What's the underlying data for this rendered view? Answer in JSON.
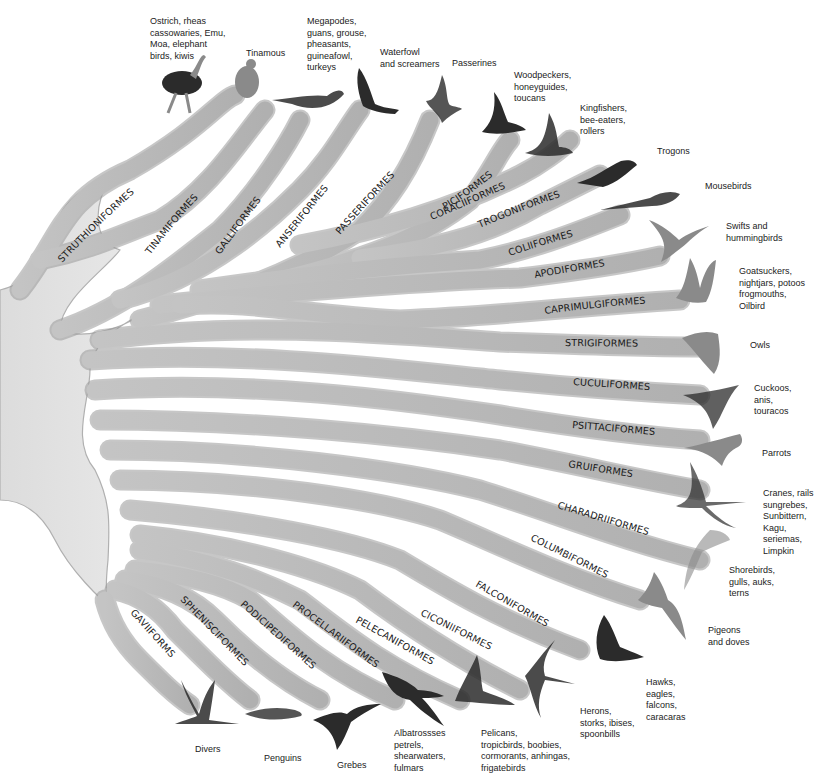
{
  "diagram": {
    "type": "phylogenetic-tree",
    "branch_color": "#b8b8b8",
    "branch_edge_color": "#8f8f8f",
    "background": "#ffffff"
  },
  "orders": [
    {
      "id": "struthioniformes",
      "label": "STRUTHIONIFORMES",
      "description": "Ostrich, rheas\ncassowaries, Emu,\nMoa, elephant\nbirds, kiwis"
    },
    {
      "id": "tinamiformes",
      "label": "TINAMIFORMES",
      "description": "Tinamous"
    },
    {
      "id": "galliformes",
      "label": "GALLIFORMES",
      "description": "Megapodes,\nguans, grouse,\npheasants,\nguineafowl,\nturkeys"
    },
    {
      "id": "anseriformes",
      "label": "ANSERIFORMES",
      "description": "Waterfowl\nand screamers"
    },
    {
      "id": "passeriformes",
      "label": "PASSERIFORMES",
      "description": "Passerines"
    },
    {
      "id": "piciformes",
      "label": "PICIFORMES",
      "description": "Woodpeckers,\nhoneyguides,\ntoucans"
    },
    {
      "id": "coraciiformes",
      "label": "CORACIIFORMES",
      "description": "Kingfishers,\nbee-eaters,\nrollers"
    },
    {
      "id": "trogoniformes",
      "label": "TROGONIFORMES",
      "description": "Trogons"
    },
    {
      "id": "coliiformes",
      "label": "COLIIFORMES",
      "description": "Mousebirds"
    },
    {
      "id": "apodiformes",
      "label": "APODIFORMES",
      "description": "Swifts and\nhummingbirds"
    },
    {
      "id": "caprimulgiformes",
      "label": "CAPRIMULGIFORMES",
      "description": "Goatsuckers,\nnightjars, potoos\nfrogmouths,\nOilbird"
    },
    {
      "id": "strigiformes",
      "label": "STRIGIFORMES",
      "description": "Owls"
    },
    {
      "id": "cuculiformes",
      "label": "CUCULIFORMES",
      "description": "Cuckoos,\nanis,\ntouracos"
    },
    {
      "id": "psittaciformes",
      "label": "PSITTACIFORMES",
      "description": "Parrots"
    },
    {
      "id": "gruiformes",
      "label": "GRUIFORMES",
      "description": "Cranes, rails\nsungrebes,\nSunbittern,\nKagu, seriemas,\nLimpkin"
    },
    {
      "id": "charadriiformes",
      "label": "CHARADRIIFORMES",
      "description": "Shorebirds,\ngulls, auks,\nterns"
    },
    {
      "id": "columbiformes",
      "label": "COLUMBIFORMES",
      "description": "Pigeons\nand doves"
    },
    {
      "id": "falconiformes",
      "label": "FALCONIFORMES",
      "description": "Hawks,\neagles,\nfalcons,\ncaracaras"
    },
    {
      "id": "ciconiiformes",
      "label": "CICONIIFORMES",
      "description": "Herons,\nstorks, ibises,\nspoonbills"
    },
    {
      "id": "pelecaniformes",
      "label": "PELECANIFORMES",
      "description": "Pelicans,\ntropicbirds, boobies,\ncormorants, anhingas,\nfrigatebirds"
    },
    {
      "id": "procellariiformes",
      "label": "PROCELLARIIFORMES",
      "description": "Albatrossses\npetrels,\nshearwaters,\nfulmars"
    },
    {
      "id": "podicipediformes",
      "label": "PODICIPEDIFORMES",
      "description": "Grebes"
    },
    {
      "id": "sphenisciformes",
      "label": "SPHENISCIFORMES",
      "description": "Penguins"
    },
    {
      "id": "gaviiformes",
      "label": "GAVIIFORMS",
      "description": "Divers"
    }
  ]
}
